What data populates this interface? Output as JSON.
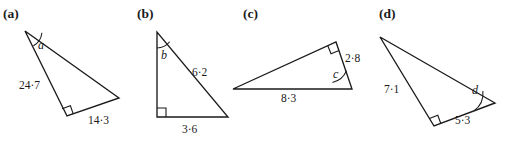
{
  "figure": {
    "width": 516,
    "height": 146,
    "background": "#ffffff",
    "ink_color": "#1a1a1a"
  },
  "panels": [
    {
      "key": "a",
      "label": "(a)",
      "label_pos": {
        "x": 3,
        "y": 18
      },
      "vertices": {
        "apex": {
          "x": 25,
          "y": 31
        },
        "right_angle": {
          "x": 67,
          "y": 116
        },
        "far": {
          "x": 119,
          "y": 98
        }
      },
      "angle": {
        "name": "a",
        "label": "a",
        "label_pos": {
          "x": 38,
          "y": 49
        },
        "arc": {
          "cx": 25,
          "cy": 31,
          "r": 17
        }
      },
      "right_angle_vertex": "right_angle",
      "sides": [
        {
          "name": "side-apex-to-right-angle",
          "label": "24·24",
          "value": "24·7",
          "label_pos": {
            "x": 19,
            "y": 89
          }
        },
        {
          "name": "side-right-angle-to-far",
          "label": "14·3",
          "value": "14·3",
          "label_pos": {
            "x": 88,
            "y": 124
          }
        }
      ]
    },
    {
      "key": "b",
      "label": "(b)",
      "label_pos": {
        "x": 137,
        "y": 18
      },
      "vertices": {
        "apex": {
          "x": 157,
          "y": 32
        },
        "right_angle": {
          "x": 157,
          "y": 117
        },
        "far": {
          "x": 228,
          "y": 117
        }
      },
      "angle": {
        "name": "b",
        "label": "b",
        "label_pos": {
          "x": 161,
          "y": 59
        },
        "arc": {
          "cx": 157,
          "cy": 32,
          "r": 16
        }
      },
      "right_angle_vertex": "right_angle",
      "sides": [
        {
          "name": "side-hypotenuse",
          "label": "6·2",
          "value": "6·2",
          "label_pos": {
            "x": 192,
            "y": 76
          }
        },
        {
          "name": "side-base",
          "label": "3·6",
          "value": "3·6",
          "label_pos": {
            "x": 182,
            "y": 133
          }
        }
      ]
    },
    {
      "key": "c",
      "label": "(c)",
      "label_pos": {
        "x": 243,
        "y": 18
      },
      "vertices": {
        "apex": {
          "x": 233,
          "y": 89
        },
        "right_angle": {
          "x": 336,
          "y": 42
        },
        "far": {
          "x": 352,
          "y": 89
        }
      },
      "angle": {
        "name": "c",
        "label": "c",
        "label_pos": {
          "x": 333,
          "y": 78
        },
        "arc": {
          "cx": 352,
          "cy": 89,
          "r": 20
        }
      },
      "right_angle_vertex": "right_angle",
      "sides": [
        {
          "name": "side-right",
          "label": "2·8",
          "value": "2·8",
          "label_pos": {
            "x": 345,
            "y": 62
          }
        },
        {
          "name": "side-base",
          "label": "8·3",
          "value": "8·3",
          "label_pos": {
            "x": 281,
            "y": 102
          }
        }
      ]
    },
    {
      "key": "d",
      "label": "(d)",
      "label_pos": {
        "x": 379,
        "y": 18
      },
      "vertices": {
        "apex": {
          "x": 380,
          "y": 37
        },
        "right_angle": {
          "x": 434,
          "y": 126
        },
        "far": {
          "x": 495,
          "y": 103
        }
      },
      "angle": {
        "name": "d",
        "label": "d",
        "label_pos": {
          "x": 472,
          "y": 94
        },
        "arc": {
          "cx": 495,
          "cy": 103,
          "r": 22
        }
      },
      "right_angle_vertex": "right_angle",
      "sides": [
        {
          "name": "side-apex-to-right-angle",
          "label": "7·1",
          "value": "7·1",
          "label_pos": {
            "x": 384,
            "y": 93
          }
        },
        {
          "name": "side-right-angle-to-far",
          "label": "5·3",
          "value": "5·3",
          "label_pos": {
            "x": 455,
            "y": 124
          }
        }
      ]
    }
  ]
}
